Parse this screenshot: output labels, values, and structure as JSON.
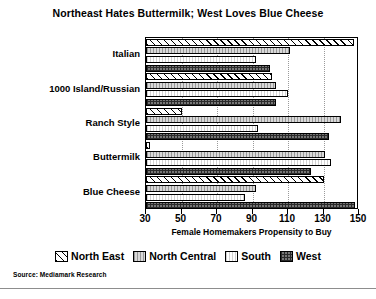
{
  "chart_data": {
    "type": "bar",
    "orientation": "horizontal",
    "title": "Northeast Hates Buttermilk; West Loves Blue Cheese",
    "xlabel": "Female Homemakers Propensity to Buy",
    "ylabel": "",
    "xlim": [
      30,
      150
    ],
    "xticks": [
      30,
      50,
      70,
      90,
      110,
      130,
      150
    ],
    "grid": "vertical-dotted",
    "legend_position": "bottom",
    "categories": [
      "Italian",
      "1000 Island/Russian",
      "Ranch Style",
      "Buttermilk",
      "Blue Cheese"
    ],
    "series": [
      {
        "name": "North East",
        "pattern": "diagonal-hatch",
        "values": [
          147,
          101,
          50,
          32,
          130
        ]
      },
      {
        "name": "North Central",
        "pattern": "light-gray",
        "values": [
          111,
          103,
          140,
          131,
          92
        ]
      },
      {
        "name": "South",
        "pattern": "white",
        "values": [
          92,
          110,
          93,
          134,
          86
        ]
      },
      {
        "name": "West",
        "pattern": "checkered",
        "values": [
          100,
          103,
          133,
          123,
          148
        ]
      }
    ],
    "source": "Source: Mediamark Research"
  },
  "legend": {
    "items": [
      {
        "label": "North East"
      },
      {
        "label": "North Central"
      },
      {
        "label": "South"
      },
      {
        "label": "West"
      }
    ]
  },
  "axis": {
    "tick_labels": [
      "30",
      "50",
      "70",
      "90",
      "110",
      "130",
      "150"
    ]
  }
}
